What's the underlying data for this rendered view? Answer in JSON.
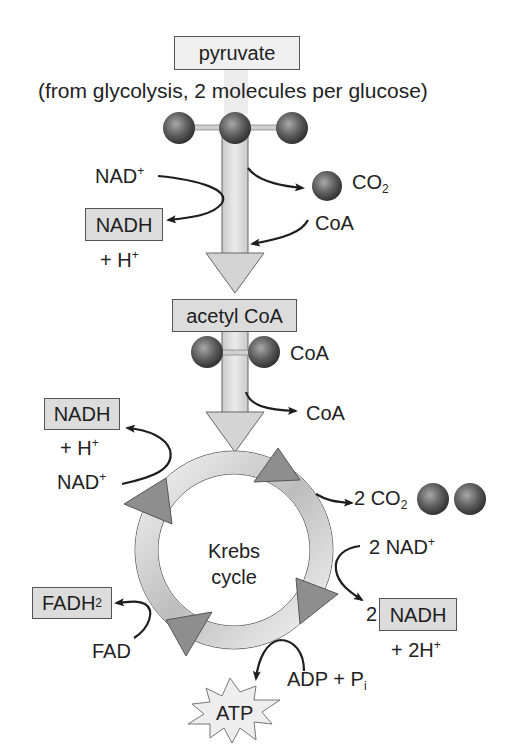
{
  "diagram": {
    "colors": {
      "box_fill": "#dcdcdc",
      "box_border": "#555555",
      "arrow_fill": "#d4d4d4",
      "ring_dark": "#8a8a8a",
      "ring_light": "#f0f0f0",
      "sphere": "#5a5a5a",
      "curve": "#222222"
    },
    "pyruvate": {
      "label": "pyruvate",
      "note": "(from glycolysis, 2 molecules per glucose)",
      "carbons": 3
    },
    "link_reaction": {
      "nad_in": {
        "main": "NAD",
        "sup": "+"
      },
      "nadh_out": {
        "label": "NADH",
        "plus": "+ H",
        "plus_sup": "+"
      },
      "co2_out": {
        "main": "CO",
        "sub": "2"
      },
      "coa_in": "CoA"
    },
    "acetyl_coa": {
      "label": "acetyl CoA",
      "carbons": 2,
      "coa_attached": "CoA",
      "coa_released": "CoA"
    },
    "krebs_cycle": {
      "label_line1": "Krebs",
      "label_line2": "cycle",
      "inputs_outputs": {
        "nadh_left": {
          "label": "NADH",
          "plus": "+ H",
          "plus_sup": "+"
        },
        "nad_left": {
          "main": "NAD",
          "sup": "+"
        },
        "co2_right": {
          "prefix": "2 CO",
          "sub": "2",
          "spheres": 2
        },
        "nad_right": {
          "main": "2 NAD",
          "sup": "+"
        },
        "nadh_right": {
          "coef": "2",
          "label": "NADH",
          "plus": "+ 2H",
          "plus_sup": "+"
        },
        "fadh2": {
          "main": "FADH",
          "sub": "2"
        },
        "fad": "FAD",
        "adp": {
          "main": "ADP + P",
          "sub": "i"
        },
        "atp": "ATP"
      }
    }
  }
}
